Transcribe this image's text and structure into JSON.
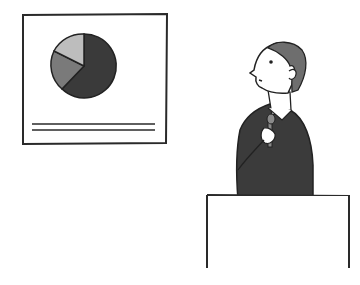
{
  "scene": {
    "description": "Cartoon of a presenter holding a microphone at a podium, looking up at a board showing a pie chart",
    "colors": {
      "background": "#ffffff",
      "outline": "#2a2a2a",
      "pie_large": "#3a3a3a",
      "pie_medium": "#7a7a7a",
      "pie_small": "#bdbdbd",
      "suit": "#3b3b3b",
      "hair": "#6e6e6e",
      "mic": "#8a8a8a"
    }
  },
  "board": {
    "pie_slices_percent": [
      62,
      23,
      15
    ]
  }
}
